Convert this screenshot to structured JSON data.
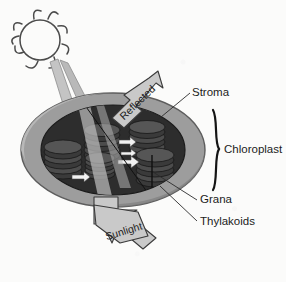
{
  "figure": {
    "background_color": "#fbfbfa"
  },
  "labels": {
    "stroma": "Stroma",
    "chloroplast": "Chloroplast",
    "grana": "Grana",
    "thylakoids": "Thylakoids"
  },
  "arrows": {
    "reflected": "Reflected",
    "sunlight": "Sunlight"
  },
  "icons": {
    "sun": "sun-icon",
    "bracket": "curly-brace-icon"
  },
  "colors": {
    "envelope_outer": "#9a9a9a",
    "envelope_highlight": "#b4b4b4",
    "stroma_fill": "#2f2f2f",
    "granum_disc": "#4a4a4a",
    "granum_disc_dark": "#313131",
    "arrow_fill": "#c9c9c9",
    "arrow_outline": "#3a3a3a",
    "beam_fill": "#c4c4c4",
    "text": "#1c1c1c",
    "leader_line": "#2b2b2b",
    "sun_outline": "#4b4b4b"
  },
  "structure": {
    "granum_stack_count": 5,
    "discs_per_stack": [
      6,
      6,
      6,
      6,
      6
    ],
    "internal_arrow_count": 4,
    "light_beam_count": 2
  }
}
